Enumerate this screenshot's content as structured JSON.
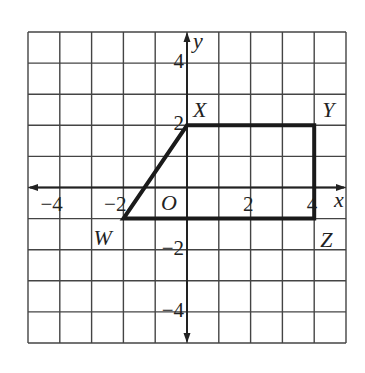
{
  "figure": {
    "type": "coordinate-plane",
    "grid": {
      "xmin": -5,
      "xmax": 5,
      "ymin": -5,
      "ymax": 5,
      "step": 1,
      "color": "#444444"
    },
    "axes": {
      "x_label": "x",
      "y_label": "y",
      "origin_label": "O",
      "color": "#222222"
    },
    "x_ticks": [
      {
        "value": -4,
        "label": "−4"
      },
      {
        "value": -2,
        "label": "−2"
      },
      {
        "value": 2,
        "label": "2"
      },
      {
        "value": 4,
        "label": "4"
      }
    ],
    "y_ticks": [
      {
        "value": 4,
        "label": "4"
      },
      {
        "value": 2,
        "label": "2"
      },
      {
        "value": -2,
        "label": "−2"
      },
      {
        "value": -4,
        "label": "−4"
      }
    ],
    "polygon": {
      "name": "WXYZ",
      "stroke": "#1a1a1a",
      "vertices": [
        {
          "label": "W",
          "x": -2,
          "y": -1
        },
        {
          "label": "X",
          "x": 0,
          "y": 2
        },
        {
          "label": "Y",
          "x": 4,
          "y": 2
        },
        {
          "label": "Z",
          "x": 4,
          "y": -1
        }
      ]
    }
  }
}
